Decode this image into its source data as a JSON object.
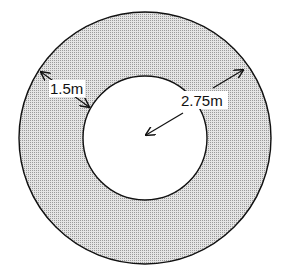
{
  "diagram": {
    "type": "annulus",
    "fill_color": "#c8c8c8",
    "stroke_color": "#111111",
    "outer_circle": {
      "cx": 145,
      "cy": 138,
      "r": 126
    },
    "inner_circle": {
      "cx": 145,
      "cy": 138,
      "r": 62
    },
    "labels": {
      "width": "1.5m",
      "outer_radius": "2.75m"
    }
  }
}
